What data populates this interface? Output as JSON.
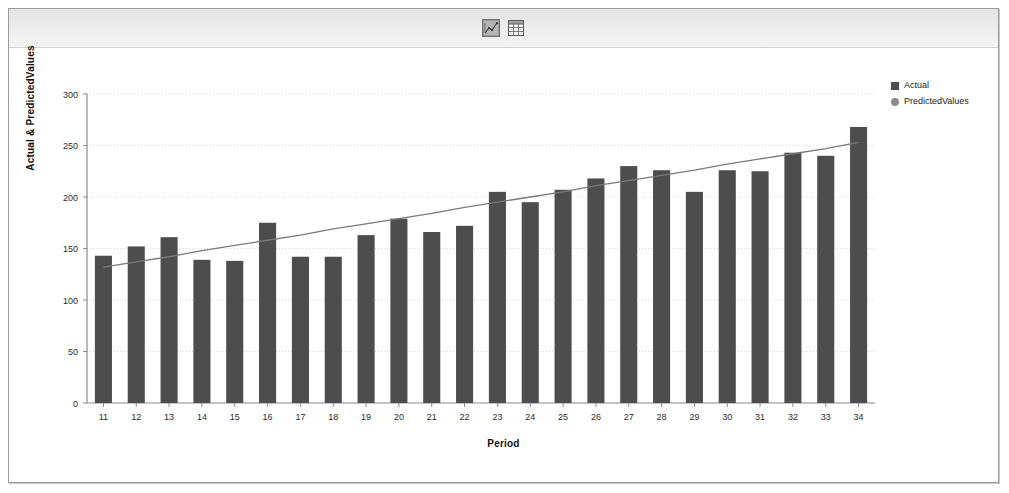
{
  "window": {
    "title": "Actual & PredictedValues chart"
  },
  "toolbar": {
    "buttons": [
      {
        "name": "chart-view-icon",
        "label": "Chart view"
      },
      {
        "name": "table-view-icon",
        "label": "Table view"
      }
    ]
  },
  "legend": {
    "position": "top-right",
    "entries": [
      {
        "label": "Actual",
        "marker": "square",
        "color": "#4d4d4d"
      },
      {
        "label": "PredictedValues",
        "marker": "circle",
        "color": "#8c8c8c"
      }
    ]
  },
  "axes": {
    "x_title": "Period",
    "y_title": "Actual & PredictedValues",
    "y_ticks": [
      "0",
      "50",
      "100",
      "150",
      "200",
      "250",
      "300"
    ]
  },
  "colors": {
    "bar": "#4d4d4d",
    "line": "#7a7a7a",
    "grid": "#d8d8d8",
    "axis": "#8a8a8a",
    "toolbar_bg": "#ececec",
    "canvas_bg": "#ffffff",
    "frame_border": "#9a9a9a"
  },
  "chart_data": {
    "type": "bar",
    "title": "",
    "xlabel": "Period",
    "ylabel": "Actual & PredictedValues",
    "ylim": [
      0,
      300
    ],
    "yticks": [
      0,
      50,
      100,
      150,
      200,
      250,
      300
    ],
    "grid": true,
    "legend_position": "top-right",
    "categories": [
      "11",
      "12",
      "13",
      "14",
      "15",
      "16",
      "17",
      "18",
      "19",
      "20",
      "21",
      "22",
      "23",
      "24",
      "25",
      "26",
      "27",
      "28",
      "29",
      "30",
      "31",
      "32",
      "33",
      "34"
    ],
    "series": [
      {
        "name": "Actual",
        "type": "bar",
        "color": "#4d4d4d",
        "values": [
          143,
          152,
          161,
          139,
          138,
          175,
          142,
          142,
          163,
          179,
          166,
          172,
          205,
          195,
          207,
          218,
          230,
          226,
          205,
          226,
          225,
          243,
          240,
          268
        ]
      },
      {
        "name": "PredictedValues",
        "type": "line",
        "color": "#7a7a7a",
        "values": [
          132,
          137,
          142,
          148,
          153,
          158,
          163,
          169,
          174,
          179,
          184,
          190,
          195,
          200,
          205,
          211,
          216,
          221,
          226,
          232,
          237,
          242,
          247,
          253
        ]
      }
    ]
  }
}
